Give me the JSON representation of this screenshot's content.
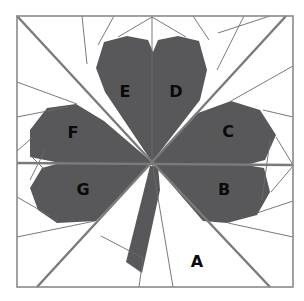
{
  "diagram": {
    "type": "foundation paper piecing pattern",
    "colors": {
      "background": "#ffffff",
      "fill": "#58585a",
      "line": "#6a6a6a",
      "border": "#8a8a8a",
      "label": "#0a0a0a"
    },
    "sections": [
      {
        "id": "A",
        "label": "A",
        "x": 197,
        "y": 262
      },
      {
        "id": "B",
        "label": "B",
        "x": 224,
        "y": 190
      },
      {
        "id": "C",
        "label": "C",
        "x": 228,
        "y": 132
      },
      {
        "id": "D",
        "label": "D",
        "x": 176,
        "y": 92
      },
      {
        "id": "E",
        "label": "E",
        "x": 125,
        "y": 92
      },
      {
        "id": "F",
        "label": "F",
        "x": 73,
        "y": 133
      },
      {
        "id": "G",
        "label": "G",
        "x": 83,
        "y": 190
      }
    ]
  }
}
